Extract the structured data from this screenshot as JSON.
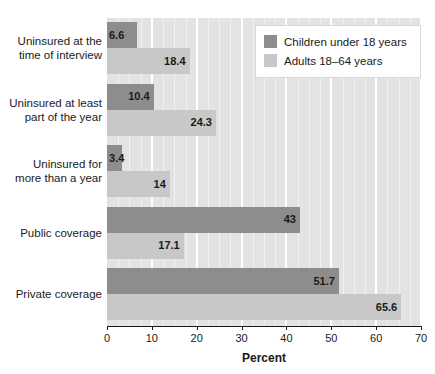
{
  "chart_data": {
    "type": "bar",
    "orientation": "horizontal",
    "title": "",
    "xlabel": "Percent",
    "ylabel": "",
    "xlim": [
      0,
      70
    ],
    "xticks": [
      0,
      10,
      20,
      30,
      40,
      50,
      60,
      70
    ],
    "xtick_labels": [
      "0",
      "10",
      "20",
      "30",
      "40",
      "50",
      "60",
      "70"
    ],
    "grid": true,
    "legend_position": "top-right",
    "categories": [
      "Uninsured at the time of interview",
      "Uninsured at least part of the year",
      "Uninsured for more than a year",
      "Public coverage",
      "Private coverage"
    ],
    "category_lines": [
      [
        "Uninsured at the",
        "time of interview"
      ],
      [
        "Uninsured at least",
        "part of the year"
      ],
      [
        "Uninsured for",
        "more than a year"
      ],
      [
        "Public coverage"
      ],
      [
        "Private coverage"
      ]
    ],
    "series": [
      {
        "name": "Children under 18 years",
        "color": "#8d8d8d",
        "values": [
          6.6,
          10.4,
          3.4,
          43,
          51.7
        ],
        "value_labels": [
          "6.6",
          "10.4",
          "3.4",
          "43",
          "51.7"
        ]
      },
      {
        "name": "Adults 18–64 years",
        "color": "#c8c8c8",
        "values": [
          18.4,
          24.3,
          14,
          17.1,
          65.6
        ],
        "value_labels": [
          "18.4",
          "24.3",
          "14",
          "17.1",
          "65.6"
        ]
      }
    ]
  },
  "legend": {
    "items": [
      {
        "label": "Children under 18 years",
        "swatch": "dark"
      },
      {
        "label": "Adults 18–64 years",
        "swatch": "light"
      }
    ]
  },
  "axis": {
    "title": "Percent",
    "ticks": [
      "0",
      "10",
      "20",
      "30",
      "40",
      "50",
      "60",
      "70"
    ]
  },
  "colors": {
    "children_bar": "#8d8d8d",
    "adults_bar": "#c8c8c8",
    "plot_background": "#e3e3e3",
    "gridline": "#ffffff",
    "text": "#1a1a1a",
    "page_background": "#ffffff"
  }
}
